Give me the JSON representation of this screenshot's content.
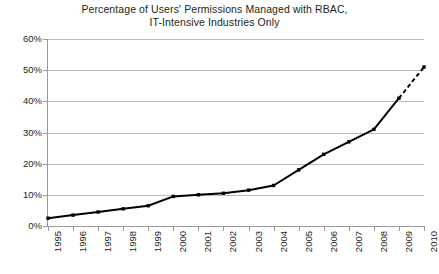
{
  "chart_data": {
    "type": "line",
    "title": "Percentage of Users' Permissions Managed with RBAC, IT-Intensive Industries Only",
    "title_line1": "Percentage of Users' Permissions Managed with RBAC,",
    "title_line2": "IT-Intensive Industries Only",
    "xlabel": "",
    "ylabel": "",
    "categories": [
      "1995",
      "1996",
      "1997",
      "1998",
      "1999",
      "2000",
      "2001",
      "2002",
      "2003",
      "2004",
      "2005",
      "2006",
      "2007",
      "2008",
      "2009",
      "2010"
    ],
    "values": [
      2.5,
      3.5,
      4.5,
      5.5,
      6.5,
      9.5,
      10,
      10.5,
      11.5,
      13,
      18,
      23,
      27,
      31,
      41,
      51
    ],
    "ylim": [
      0,
      60
    ],
    "ytick_values": [
      0,
      10,
      20,
      30,
      40,
      50,
      60
    ],
    "ytick_labels": [
      "0%",
      "10%",
      "20%",
      "30%",
      "40%",
      "50%",
      "60%"
    ],
    "grid": true,
    "legend": "none",
    "marker": "square",
    "line_color": "#000000",
    "grid_color": "#b9b9b9",
    "axis_color": "#9a9a9a",
    "dashed_from_index": 14,
    "dashed_note": "final 2009-2010 segment drawn dashed (projected)"
  }
}
